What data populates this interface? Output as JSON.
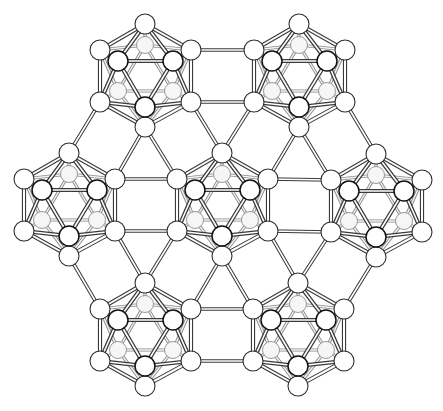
{
  "figure": {
    "title": "",
    "background": "#ffffff",
    "line_color": "#3a3a3a",
    "atom_fill": "#ffffff"
  },
  "icosahedra": [
    {
      "id": "ico-top-left",
      "cx": 145,
      "cy": 76
    },
    {
      "id": "ico-top-right",
      "cx": 299,
      "cy": 76
    },
    {
      "id": "ico-middle-left",
      "cx": 69,
      "cy": 205
    },
    {
      "id": "ico-middle-center",
      "cx": 222,
      "cy": 205
    },
    {
      "id": "ico-middle-right",
      "cx": 376,
      "cy": 206
    },
    {
      "id": "ico-bottom-left",
      "cx": 145,
      "cy": 335
    },
    {
      "id": "ico-bottom-right",
      "cx": 298,
      "cy": 335
    }
  ],
  "icosahedron_geometry": {
    "outer_top": [
      0,
      -52
    ],
    "outer_bottom": [
      0,
      51
    ],
    "outer_upper_left": [
      -45,
      -26
    ],
    "outer_upper_right": [
      46,
      -26
    ],
    "outer_lower_left": [
      -45,
      26
    ],
    "outer_lower_right": [
      46,
      26
    ],
    "front_upper_left": [
      -27,
      -15
    ],
    "front_upper_right": [
      28,
      -15
    ],
    "front_bottom": [
      0,
      31
    ],
    "back_top": [
      0,
      -31
    ],
    "back_lower_left": [
      -27,
      15
    ],
    "back_lower_right": [
      28,
      15
    ],
    "atom_radius": 10
  },
  "links": [
    [
      "ico-top-left",
      "outer_upper_right",
      "ico-top-right",
      "outer_upper_left"
    ],
    [
      "ico-top-left",
      "outer_lower_right",
      "ico-top-right",
      "outer_lower_left"
    ],
    [
      "ico-top-left",
      "outer_lower_left",
      "ico-middle-left",
      "outer_top"
    ],
    [
      "ico-top-left",
      "outer_bottom",
      "ico-middle-left",
      "outer_upper_right"
    ],
    [
      "ico-top-left",
      "outer_bottom",
      "ico-middle-center",
      "outer_upper_left"
    ],
    [
      "ico-top-left",
      "outer_lower_right",
      "ico-middle-center",
      "outer_top"
    ],
    [
      "ico-top-right",
      "outer_lower_left",
      "ico-middle-center",
      "outer_top"
    ],
    [
      "ico-top-right",
      "outer_bottom",
      "ico-middle-center",
      "outer_upper_right"
    ],
    [
      "ico-top-right",
      "outer_bottom",
      "ico-middle-right",
      "outer_upper_left"
    ],
    [
      "ico-top-right",
      "outer_lower_right",
      "ico-middle-right",
      "outer_top"
    ],
    [
      "ico-middle-left",
      "outer_upper_right",
      "ico-middle-center",
      "outer_upper_left"
    ],
    [
      "ico-middle-left",
      "outer_lower_right",
      "ico-middle-center",
      "outer_lower_left"
    ],
    [
      "ico-middle-center",
      "outer_upper_right",
      "ico-middle-right",
      "outer_upper_left"
    ],
    [
      "ico-middle-center",
      "outer_lower_right",
      "ico-middle-right",
      "outer_lower_left"
    ],
    [
      "ico-middle-left",
      "outer_lower_right",
      "ico-bottom-left",
      "outer_top"
    ],
    [
      "ico-middle-left",
      "outer_bottom",
      "ico-bottom-left",
      "outer_upper_left"
    ],
    [
      "ico-middle-center",
      "outer_lower_left",
      "ico-bottom-left",
      "outer_top"
    ],
    [
      "ico-middle-center",
      "outer_bottom",
      "ico-bottom-left",
      "outer_upper_right"
    ],
    [
      "ico-middle-center",
      "outer_bottom",
      "ico-bottom-right",
      "outer_upper_left"
    ],
    [
      "ico-middle-center",
      "outer_lower_right",
      "ico-bottom-right",
      "outer_top"
    ],
    [
      "ico-middle-right",
      "outer_lower_left",
      "ico-bottom-right",
      "outer_top"
    ],
    [
      "ico-middle-right",
      "outer_bottom",
      "ico-bottom-right",
      "outer_upper_right"
    ],
    [
      "ico-bottom-left",
      "outer_upper_right",
      "ico-bottom-right",
      "outer_upper_left"
    ],
    [
      "ico-bottom-left",
      "outer_lower_right",
      "ico-bottom-right",
      "outer_lower_left"
    ]
  ]
}
